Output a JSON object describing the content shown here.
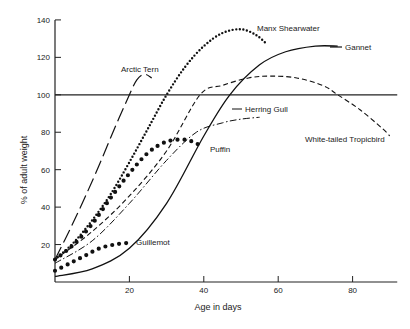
{
  "chart_data": {
    "type": "line",
    "title": "",
    "xlabel": "Age in days",
    "ylabel": "% of adult weight",
    "xlim": [
      0,
      92
    ],
    "ylim": [
      0,
      140
    ],
    "xticks": [
      20,
      40,
      60,
      80
    ],
    "yticks": [
      20,
      40,
      60,
      80,
      100,
      120,
      140
    ],
    "grid": false,
    "reference_line": {
      "y": 100
    },
    "legend_position": "inline labels",
    "series": [
      {
        "name": "Arctic Tern",
        "style": "long-dash",
        "x": [
          0,
          4,
          8,
          12,
          16,
          20,
          22,
          24,
          26
        ],
        "y": [
          12,
          28,
          45,
          63,
          82,
          100,
          108,
          111,
          109
        ]
      },
      {
        "name": "Manx Shearwater",
        "style": "dotted",
        "x": [
          0,
          5,
          10,
          15,
          20,
          25,
          30,
          35,
          40,
          45,
          50,
          54,
          57
        ],
        "y": [
          12,
          21,
          33,
          47,
          64,
          82,
          100,
          115,
          126,
          133,
          135,
          132,
          127
        ]
      },
      {
        "name": "Gannet",
        "style": "solid",
        "x": [
          0,
          10,
          20,
          30,
          40,
          47,
          55,
          62,
          70,
          76
        ],
        "y": [
          3,
          7,
          18,
          42,
          78,
          100,
          116,
          123,
          126,
          126
        ]
      },
      {
        "name": "White-tailed Tropicbird",
        "style": "dashed",
        "x": [
          0,
          10,
          20,
          30,
          39,
          45,
          52,
          58,
          65,
          72,
          76,
          82,
          88,
          90
        ],
        "y": [
          12,
          27,
          46,
          70,
          100,
          105,
          109,
          110,
          109,
          105,
          100,
          92,
          82,
          78
        ]
      },
      {
        "name": "Herring Gull",
        "style": "dash-dot",
        "x": [
          0,
          10,
          20,
          30,
          38,
          45,
          50,
          55
        ],
        "y": [
          10,
          22,
          42,
          65,
          80,
          85,
          87,
          88
        ]
      },
      {
        "name": "Puffin",
        "style": "large-dots",
        "x": [
          0,
          5,
          10,
          15,
          20,
          25,
          30,
          35,
          38,
          40
        ],
        "y": [
          12,
          20,
          31,
          45,
          58,
          69,
          75,
          76,
          74,
          72
        ]
      },
      {
        "name": "Guillemot",
        "style": "large-dots",
        "x": [
          0,
          4,
          8,
          12,
          16,
          20
        ],
        "y": [
          6,
          10,
          14,
          18,
          20,
          21
        ]
      }
    ]
  }
}
